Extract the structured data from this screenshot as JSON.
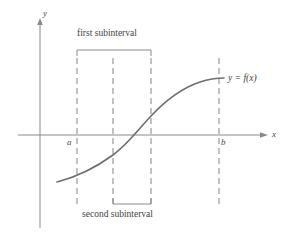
{
  "figure": {
    "title": "",
    "colors": {
      "curve": "#6e6e6e",
      "axis": "#8a8a8a",
      "dashed": "#8f8f8f",
      "bracket": "#8a8a8a",
      "text": "#4a4a4a",
      "background": "#ffffff"
    },
    "axes": {
      "y_label": "y",
      "x_label": "x",
      "origin": {
        "x": 40,
        "y": 135
      },
      "x_axis_end": 268,
      "y_axis_top": 20,
      "y_axis_bottom": 228
    },
    "curve": {
      "label": "y = f(x)",
      "label_x": 228,
      "label_y": 75,
      "shape": "sigmoid",
      "start": {
        "x": 57,
        "y": 182
      },
      "end": {
        "x": 224,
        "y": 78
      },
      "crossing_x": 142
    },
    "tick_labels": [
      {
        "name": "a",
        "x": 70,
        "y": 138
      },
      {
        "name": "b",
        "x": 222,
        "y": 138
      }
    ],
    "dashed_lines": [
      {
        "id": "line-a",
        "x": 77,
        "y_top": 58,
        "y_bottom": 208
      },
      {
        "id": "line-1",
        "x": 113,
        "y_top": 58,
        "y_bottom": 208
      },
      {
        "id": "line-2",
        "x": 151,
        "y_top": 58,
        "y_bottom": 208
      },
      {
        "id": "line-b",
        "x": 219,
        "y_top": 58,
        "y_bottom": 208
      }
    ],
    "brackets": [
      {
        "id": "first-subinterval",
        "label": "first subinterval",
        "label_x": 80,
        "label_y": 28,
        "x_start": 77,
        "x_end": 151,
        "y": 50,
        "tick_dir": "down",
        "tick_len": 6
      },
      {
        "id": "second-subinterval",
        "label": "second subinterval",
        "label_x": 80,
        "label_y": 211,
        "x_start": 113,
        "x_end": 151,
        "y": 204,
        "tick_dir": "up",
        "tick_len": 6
      }
    ]
  }
}
